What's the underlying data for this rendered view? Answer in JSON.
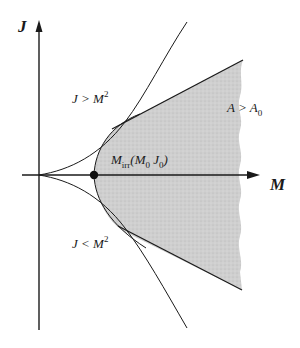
{
  "diagram": {
    "axes": {
      "x_label": "M",
      "y_label": "J"
    },
    "regions": {
      "upper_label_main": "J > M",
      "upper_label_sup": "2",
      "lower_label_main": "J < M",
      "lower_label_sup": "2",
      "shaded_label_main": "A > A",
      "shaded_label_sub": "0"
    },
    "point": {
      "label_main": "M",
      "label_sub": "irr",
      "label_args_open": "(M",
      "label_args_sub1": "0",
      "label_args_mid": " J",
      "label_args_sub2": "0",
      "label_args_close": ")"
    },
    "colors": {
      "line": "#1a1a1a",
      "shade": "#c8c8c8",
      "background": "#ffffff"
    }
  }
}
